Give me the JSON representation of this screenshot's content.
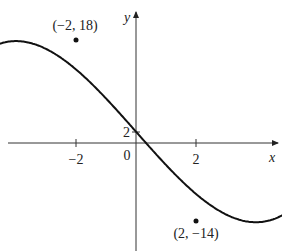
{
  "chart_data": {
    "type": "line",
    "title": "",
    "function": "x^3 - 12x + 2",
    "xlabel": "x",
    "ylabel": "y",
    "x_ticks": [
      {
        "value": -2,
        "label": "−2"
      },
      {
        "value": 2,
        "label": "2"
      }
    ],
    "y_ticks": [
      {
        "value": 2,
        "label": "2"
      }
    ],
    "origin_label": "0",
    "grid": false,
    "xlim": [
      -4.5,
      4.5
    ],
    "ylim": [
      -20,
      24
    ],
    "annotations": [
      {
        "x": -2,
        "y": 18,
        "text": "(−2, 18)",
        "type": "local-max"
      },
      {
        "x": 2,
        "y": -14,
        "text": "(2, −14)",
        "type": "local-min"
      }
    ],
    "series": [
      {
        "name": "f(x)",
        "x": [
          -3.9,
          -3.5,
          -3,
          -2.5,
          -2,
          -1.5,
          -1,
          -0.5,
          0,
          0.5,
          1,
          1.5,
          2,
          2.5,
          3,
          3.5,
          3.9
        ],
        "y": [
          -10.5,
          1.1,
          11,
          16.4,
          18,
          16.6,
          13,
          7.9,
          2,
          -3.9,
          -9,
          -12.6,
          -14,
          -12.4,
          -7,
          2.9,
          14.5
        ]
      }
    ]
  }
}
